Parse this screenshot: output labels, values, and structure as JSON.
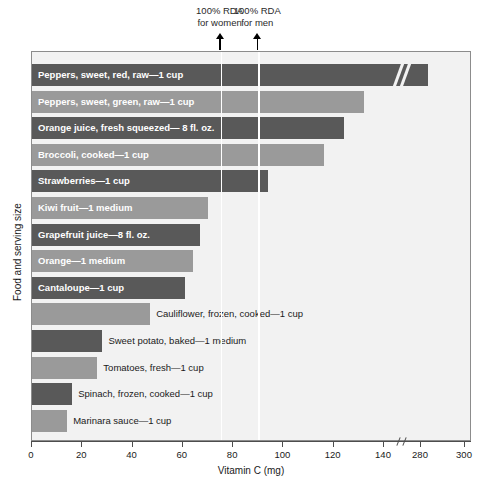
{
  "chart_data": {
    "type": "bar",
    "orientation": "horizontal",
    "title": "",
    "xlabel": "Vitamin C (mg)",
    "ylabel": "Food and serving size",
    "xlim": [
      0,
      300
    ],
    "xticks": [
      0,
      20,
      40,
      60,
      80,
      100,
      120,
      140,
      280,
      300
    ],
    "xtick_labels": [
      "0",
      "20",
      "40",
      "60",
      "80",
      "100",
      "120",
      "140",
      "280",
      "300"
    ],
    "axis_break": {
      "after": 140,
      "before": 280,
      "note": "x-axis broken between 140 and 280 mg"
    },
    "grid": false,
    "legend": null,
    "categories": [
      "Peppers, sweet, red, raw—1 cup",
      "Peppers, sweet, green, raw—1 cup",
      "Orange juice, fresh squeezed— 8 fl. oz.",
      "Broccoli, cooked—1 cup",
      "Strawberries—1 cup",
      "Kiwi fruit—1 medium",
      "Grapefruit juice—8 fl. oz.",
      "Orange—1 medium",
      "Cantaloupe—1 cup",
      "Cauliflower, frozen, cooked—1 cup",
      "Sweet potato, baked—1 medium",
      "Tomatoes, fresh—1 cup",
      "Spinach, frozen, cooked—1 cup",
      "Marinara sauce—1 cup"
    ],
    "values": [
      283,
      132,
      124,
      116,
      94,
      70,
      67,
      64,
      61,
      47,
      28,
      26,
      16,
      14
    ],
    "annotations": [
      {
        "name": "rda-women",
        "value": 75,
        "line1": "100% RDA",
        "line2": "for women"
      },
      {
        "name": "rda-men",
        "value": 90,
        "line1": "100% RDA",
        "line2": "for men"
      }
    ],
    "colors": {
      "bar_dark": "#595959",
      "bar_light": "#9a9a9a",
      "plot_background": "#f2f2f2",
      "plot_border": "#8c8c8c",
      "rda_line": "#ffffff",
      "label_inside": "#ffffff",
      "label_outside": "#1a1a1a",
      "axis": "#4d4d4d"
    },
    "bar_label_placement": [
      "inside",
      "inside",
      "inside",
      "inside",
      "inside",
      "inside",
      "inside",
      "inside",
      "inside",
      "outside",
      "outside",
      "outside",
      "outside",
      "outside"
    ]
  }
}
